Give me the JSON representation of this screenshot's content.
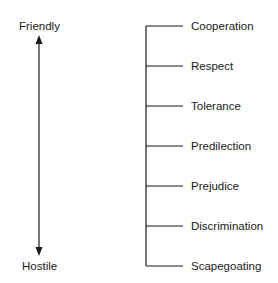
{
  "scale": {
    "top_label": "Friendly",
    "bottom_label": "Hostile"
  },
  "levels": [
    {
      "label": "Cooperation"
    },
    {
      "label": "Respect"
    },
    {
      "label": "Tolerance"
    },
    {
      "label": "Predilection"
    },
    {
      "label": "Prejudice"
    },
    {
      "label": "Discrimination"
    },
    {
      "label": "Scapegoating"
    }
  ]
}
